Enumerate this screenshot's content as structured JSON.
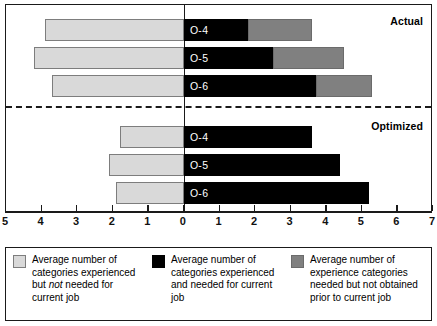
{
  "chart_data": {
    "type": "bar",
    "orientation": "horizontal",
    "layout": "diverging-stacked",
    "title": "",
    "xlabel": "",
    "ylabel": "",
    "xlim": [
      -5,
      7
    ],
    "x_ticks": [
      -5,
      -4,
      -3,
      -2,
      -1,
      0,
      1,
      2,
      3,
      4,
      5,
      6,
      7
    ],
    "x_tick_labels": [
      "5",
      "4",
      "3",
      "2",
      "1",
      "0",
      "1",
      "2",
      "3",
      "4",
      "5",
      "6",
      "7"
    ],
    "grid": false,
    "legend_position": "bottom",
    "groups": [
      {
        "name": "Actual",
        "label": "Actual",
        "categories": [
          "O-4",
          "O-5",
          "O-6"
        ],
        "series": [
          {
            "name": "experienced_not_needed",
            "key": "left",
            "values": [
              3.9,
              4.2,
              3.7
            ]
          },
          {
            "name": "experienced_and_needed",
            "key": "mid",
            "values": [
              1.8,
              2.5,
              3.7
            ]
          },
          {
            "name": "needed_not_obtained",
            "key": "right",
            "values": [
              1.8,
              2.0,
              1.6
            ]
          }
        ]
      },
      {
        "name": "Optimized",
        "label": "Optimized",
        "categories": [
          "O-4",
          "O-5",
          "O-6"
        ],
        "series": [
          {
            "name": "experienced_not_needed",
            "key": "left",
            "values": [
              1.8,
              2.1,
              1.9
            ]
          },
          {
            "name": "experienced_and_needed",
            "key": "mid",
            "values": [
              3.6,
              4.4,
              5.2
            ]
          },
          {
            "name": "needed_not_obtained",
            "key": "right",
            "values": [
              0,
              0,
              0
            ]
          }
        ]
      }
    ],
    "legend": [
      {
        "swatch": "light-gray",
        "color": "#d9d9d9",
        "text_parts": [
          "Average number of categories experienced but ",
          "not",
          " needed for current job"
        ],
        "text": "Average number of categories experienced but not needed for current job"
      },
      {
        "swatch": "black",
        "color": "#000000",
        "text_parts": [
          "Average number of categories experienced and needed for current job",
          "",
          ""
        ],
        "text": "Average number of categories experienced and needed for current job"
      },
      {
        "swatch": "gray",
        "color": "#808080",
        "text_parts": [
          "Average number of experience categories needed but not obtained prior to current job",
          "",
          ""
        ],
        "text": "Average number of experience categories needed but not obtained prior to current job"
      }
    ]
  },
  "colors": {
    "left_segment": "#d9d9d9",
    "mid_segment": "#000000",
    "right_segment": "#808080",
    "axis": "#1a1a1a",
    "background": "#ffffff"
  }
}
